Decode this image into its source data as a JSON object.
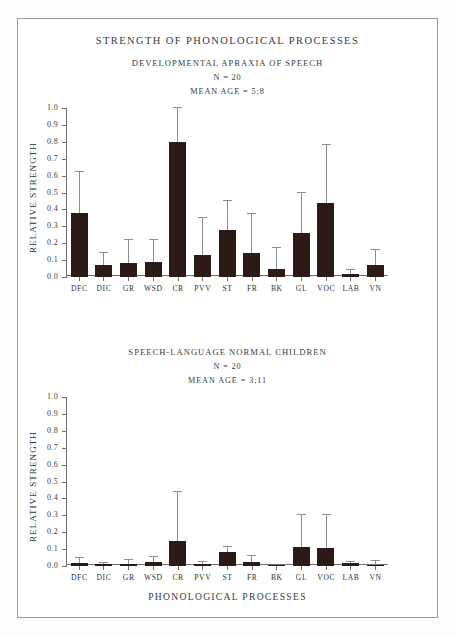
{
  "figure": {
    "title": "STRENGTH OF PHONOLOGICAL PROCESSES",
    "xaxis_title": "PHONOLOGICAL PROCESSES",
    "ylabel": "RELATIVE STRENGTH",
    "bar_color": "#2b1a16",
    "error_color": "#8d8d8d",
    "axis_color": "#6f6f6f",
    "frame_color": "#9a9a9a"
  },
  "panels": [
    {
      "title": "DEVELOPMENTAL APRAXIA OF SPEECH",
      "n_label": "N = 20",
      "mean_age_label": "MEAN AGE =  5;8"
    },
    {
      "title": "SPEECH-LANGUAGE NORMAL CHILDREN",
      "n_label": "N = 20",
      "mean_age_label": "MEAN AGE =  3;11"
    }
  ],
  "chart_data": [
    {
      "type": "bar",
      "title": "DEVELOPMENTAL APRAXIA OF SPEECH",
      "subtitle": "N = 20; MEAN AGE =  5;8",
      "xlabel": "PHONOLOGICAL PROCESSES",
      "ylabel": "RELATIVE STRENGTH",
      "ylim": [
        0.0,
        1.0
      ],
      "yticks": [
        "0.0",
        "0.1",
        "0.2",
        "0.3",
        "0.4",
        "0.5",
        "0.6",
        "0.7",
        "0.8",
        "0.9",
        "1.0"
      ],
      "ytick_values": [
        0.0,
        0.1,
        0.2,
        0.3,
        0.4,
        0.5,
        0.6,
        0.7,
        0.8,
        0.9,
        1.0
      ],
      "grid": false,
      "legend": "none",
      "categories": [
        "DFC",
        "DIC",
        "GR",
        "WSD",
        "CR",
        "PVV",
        "ST",
        "FR",
        "BK",
        "GL",
        "VOC",
        "LAB",
        "VN"
      ],
      "values": [
        0.38,
        0.07,
        0.08,
        0.09,
        0.8,
        0.13,
        0.28,
        0.14,
        0.05,
        0.26,
        0.44,
        0.02,
        0.07
      ],
      "error_upper": [
        0.62,
        0.14,
        0.22,
        0.22,
        1.0,
        0.35,
        0.45,
        0.37,
        0.17,
        0.5,
        0.78,
        0.04,
        0.16
      ]
    },
    {
      "type": "bar",
      "title": "SPEECH-LANGUAGE NORMAL CHILDREN",
      "subtitle": "N = 20; MEAN AGE =  3;11",
      "xlabel": "PHONOLOGICAL PROCESSES",
      "ylabel": "RELATIVE STRENGTH",
      "ylim": [
        0.0,
        1.0
      ],
      "yticks": [
        "0.0",
        "0.1",
        "0.2",
        "0.3",
        "0.4",
        "0.5",
        "0.6",
        "0.7",
        "0.8",
        "0.9",
        "1.0"
      ],
      "ytick_values": [
        0.0,
        0.1,
        0.2,
        0.3,
        0.4,
        0.5,
        0.6,
        0.7,
        0.8,
        0.9,
        1.0
      ],
      "grid": false,
      "legend": "none",
      "categories": [
        "DFC",
        "DIC",
        "GR",
        "WSD",
        "CR",
        "PVV",
        "ST",
        "FR",
        "BK",
        "GL",
        "VOC",
        "LAB",
        "VN"
      ],
      "values": [
        0.015,
        0.01,
        0.012,
        0.022,
        0.15,
        0.012,
        0.08,
        0.022,
        0.008,
        0.11,
        0.105,
        0.015,
        0.006
      ],
      "error_upper": [
        0.045,
        0.018,
        0.035,
        0.055,
        0.44,
        0.022,
        0.115,
        0.06,
        0.012,
        0.3,
        0.3,
        0.022,
        0.03
      ]
    }
  ]
}
